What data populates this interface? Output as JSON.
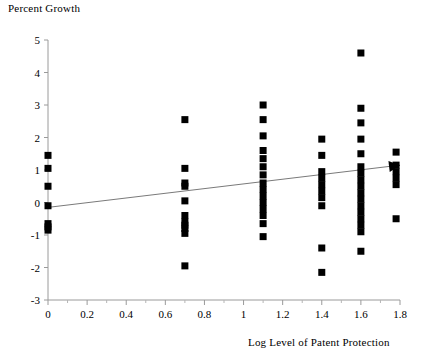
{
  "chart_data": {
    "type": "scatter",
    "title": "Percent Growth",
    "xlabel": "Log Level of Patent Protection",
    "ylabel": "Percent Growth",
    "xlim": [
      0,
      1.8
    ],
    "ylim": [
      -3,
      5
    ],
    "grid": false,
    "legend": null,
    "xticks": [
      0,
      0.2,
      0.4,
      0.6,
      0.8,
      1,
      1.2,
      1.4,
      1.6,
      1.8
    ],
    "xtick_labels": [
      "0",
      "0.2",
      "0.4",
      "0.6",
      "0.8",
      "1",
      "1.2",
      "1.4",
      "1.6",
      "1.8"
    ],
    "yticks": [
      -3,
      -2,
      -1,
      0,
      1,
      2,
      3,
      4,
      5
    ],
    "ytick_labels": [
      "-3",
      "-2",
      "-1",
      "0",
      "1",
      "2",
      "3",
      "4",
      "5"
    ],
    "minor_xticks": [
      0.1,
      0.3,
      0.5,
      0.7,
      0.9,
      1.1,
      1.3,
      1.5,
      1.7
    ],
    "marker": "filled-square",
    "marker_color": "#000000",
    "marker_size": 7,
    "points": [
      {
        "x": 0,
        "y": 1.45
      },
      {
        "x": 0,
        "y": 1.05
      },
      {
        "x": 0,
        "y": 0.5
      },
      {
        "x": 0,
        "y": -0.1
      },
      {
        "x": 0,
        "y": -0.65
      },
      {
        "x": 0,
        "y": -0.75
      },
      {
        "x": 0,
        "y": -0.85
      },
      {
        "x": 0.7,
        "y": 2.55
      },
      {
        "x": 0.7,
        "y": 1.05
      },
      {
        "x": 0.7,
        "y": 0.6
      },
      {
        "x": 0.7,
        "y": 0.5
      },
      {
        "x": 0.7,
        "y": 0.05
      },
      {
        "x": 0.7,
        "y": -0.4
      },
      {
        "x": 0.7,
        "y": -0.6
      },
      {
        "x": 0.7,
        "y": -0.7
      },
      {
        "x": 0.7,
        "y": -0.8
      },
      {
        "x": 0.7,
        "y": -0.95
      },
      {
        "x": 0.7,
        "y": -1.95
      },
      {
        "x": 1.1,
        "y": 3.0
      },
      {
        "x": 1.1,
        "y": 2.55
      },
      {
        "x": 1.1,
        "y": 2.05
      },
      {
        "x": 1.1,
        "y": 1.6
      },
      {
        "x": 1.1,
        "y": 1.35
      },
      {
        "x": 1.1,
        "y": 1.1
      },
      {
        "x": 1.1,
        "y": 0.85
      },
      {
        "x": 1.1,
        "y": 0.6
      },
      {
        "x": 1.1,
        "y": 0.4
      },
      {
        "x": 1.1,
        "y": 0.2
      },
      {
        "x": 1.1,
        "y": 0.0
      },
      {
        "x": 1.1,
        "y": -0.2
      },
      {
        "x": 1.1,
        "y": -0.4
      },
      {
        "x": 1.1,
        "y": -0.65
      },
      {
        "x": 1.1,
        "y": -1.05
      },
      {
        "x": 1.4,
        "y": 1.95
      },
      {
        "x": 1.4,
        "y": 1.45
      },
      {
        "x": 1.4,
        "y": 0.95
      },
      {
        "x": 1.4,
        "y": 0.75
      },
      {
        "x": 1.4,
        "y": 0.55
      },
      {
        "x": 1.4,
        "y": 0.35
      },
      {
        "x": 1.4,
        "y": 0.15
      },
      {
        "x": 1.4,
        "y": -0.1
      },
      {
        "x": 1.4,
        "y": -1.4
      },
      {
        "x": 1.4,
        "y": -2.15
      },
      {
        "x": 1.6,
        "y": 4.6
      },
      {
        "x": 1.6,
        "y": 2.9
      },
      {
        "x": 1.6,
        "y": 2.45
      },
      {
        "x": 1.6,
        "y": 1.95
      },
      {
        "x": 1.6,
        "y": 1.5
      },
      {
        "x": 1.6,
        "y": 1.1
      },
      {
        "x": 1.6,
        "y": 0.9
      },
      {
        "x": 1.6,
        "y": 0.7
      },
      {
        "x": 1.6,
        "y": 0.5
      },
      {
        "x": 1.6,
        "y": 0.3
      },
      {
        "x": 1.6,
        "y": 0.1
      },
      {
        "x": 1.6,
        "y": -0.1
      },
      {
        "x": 1.6,
        "y": -0.3
      },
      {
        "x": 1.6,
        "y": -0.5
      },
      {
        "x": 1.6,
        "y": -0.7
      },
      {
        "x": 1.6,
        "y": -0.9
      },
      {
        "x": 1.6,
        "y": -1.5
      },
      {
        "x": 1.78,
        "y": 1.55
      },
      {
        "x": 1.78,
        "y": 1.15
      },
      {
        "x": 1.78,
        "y": 0.95
      },
      {
        "x": 1.78,
        "y": 0.75
      },
      {
        "x": 1.78,
        "y": 0.55
      },
      {
        "x": 1.78,
        "y": -0.5
      }
    ],
    "trendline": {
      "x0": 0,
      "y0": -0.15,
      "x1": 1.8,
      "y1": 1.15,
      "color": "#7a7a7a",
      "arrow_end": true
    }
  }
}
